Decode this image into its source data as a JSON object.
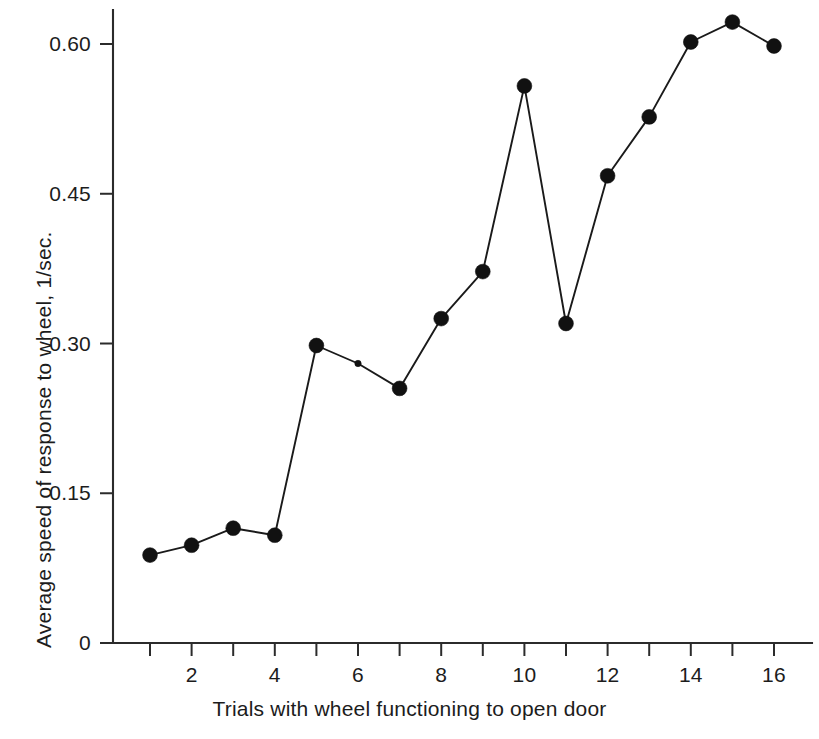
{
  "chart_data": {
    "type": "line",
    "title": "",
    "subtitle": "",
    "xlabel": "Trials with wheel functioning to open door",
    "ylabel": "Average speed of response to wheel, 1/sec.",
    "x": [
      1,
      2,
      3,
      4,
      5,
      6,
      7,
      8,
      9,
      10,
      11,
      12,
      13,
      14,
      15,
      16
    ],
    "values": [
      0.088,
      0.098,
      0.115,
      0.108,
      0.298,
      0.28,
      0.255,
      0.325,
      0.372,
      0.558,
      0.32,
      0.468,
      0.527,
      0.602,
      0.622,
      0.598
    ],
    "series": [
      {
        "name": "Average speed of response",
        "values": [
          0.088,
          0.098,
          0.115,
          0.108,
          0.298,
          0.28,
          0.255,
          0.325,
          0.372,
          0.558,
          0.32,
          0.468,
          0.527,
          0.602,
          0.622,
          0.598
        ]
      }
    ],
    "xlim": [
      0.4,
      16.6
    ],
    "ylim": [
      0,
      0.648
    ],
    "x_ticks": [
      1,
      2,
      3,
      4,
      5,
      6,
      7,
      8,
      9,
      10,
      11,
      12,
      13,
      14,
      15,
      16
    ],
    "x_tick_labels": [
      "",
      "2",
      "",
      "4",
      "",
      "6",
      "",
      "8",
      "",
      "10",
      "",
      "12",
      "",
      "14",
      "",
      "16"
    ],
    "y_ticks": [
      0,
      0.15,
      0.3,
      0.45,
      0.6
    ],
    "y_tick_labels": [
      "0",
      "0.15",
      "0.30",
      "0.45",
      "0.60"
    ],
    "grid": false,
    "legend": false,
    "legend_position": "none",
    "marker": "filled-circle",
    "line_color": "#1a1a1a",
    "marker_color": "#111111",
    "background_color": "#ffffff"
  },
  "axes": {
    "y_title": "Average speed of response to wheel, 1/sec.",
    "x_title": "Trials with wheel functioning to open door"
  }
}
